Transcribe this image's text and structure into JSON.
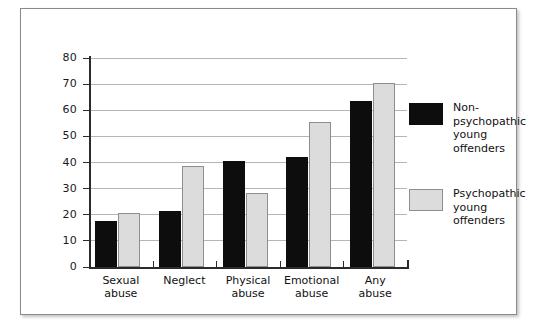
{
  "chart_data": {
    "type": "bar",
    "title": "",
    "subtitle": "",
    "xlabel": "",
    "ylabel": "",
    "ylim": [
      0,
      80
    ],
    "yticks": [
      0,
      10,
      20,
      30,
      40,
      50,
      60,
      70,
      80
    ],
    "ytick_labels": [
      "0",
      "10",
      "20",
      "30",
      "40",
      "50",
      "60",
      "70",
      "80"
    ],
    "grid": true,
    "legend_position": "right",
    "categories": [
      "Sexual abuse",
      "Neglect",
      "Physical abuse",
      "Emotional abuse",
      "Any abuse"
    ],
    "category_lines": [
      [
        "Sexual",
        "abuse"
      ],
      [
        "Neglect",
        ""
      ],
      [
        "Physical",
        "abuse"
      ],
      [
        "Emotional",
        "abuse"
      ],
      [
        "Any",
        "abuse"
      ]
    ],
    "series": [
      {
        "name": "Non-psychopathic young offenders",
        "name_lines": [
          "Non-",
          "psychopathic",
          "young",
          "offenders"
        ],
        "color": "#0d0d0d",
        "values": [
          17.5,
          21.5,
          40.5,
          42.0,
          63.5
        ]
      },
      {
        "name": "Psychopathic young offenders",
        "name_lines": [
          "Psychopathic",
          "young",
          "offenders"
        ],
        "color": "#dcdcdc",
        "values": [
          20.5,
          38.5,
          28.5,
          55.5,
          70.5
        ]
      }
    ]
  },
  "colors": {
    "series_dark": "#0d0d0d",
    "series_light": "#dcdcdc",
    "axis": "#2b2b2b",
    "gridline": "#b5b5b5",
    "frame_border": "#8a8a8a",
    "background": "#ffffff"
  }
}
